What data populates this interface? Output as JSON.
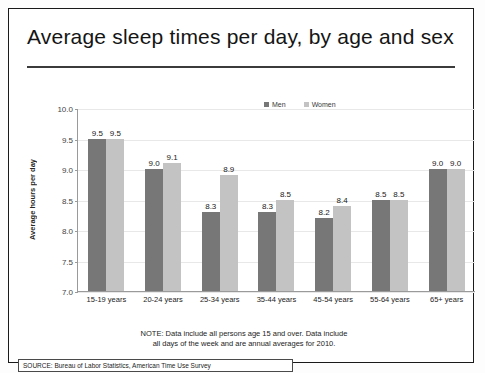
{
  "title": "Average sleep times per day, by age and sex",
  "note_line1": "NOTE: Data include all persons age 15 and over.  Data include",
  "note_line2": "all days of the week and are annual averages for 2010.",
  "source": "SOURCE: Bureau of Labor Statistics, American Time Use Survey",
  "colors": {
    "men": "#777777",
    "women": "#c3c3c3"
  },
  "chart_data": {
    "type": "bar",
    "title": "Average sleep times per day, by age and sex",
    "xlabel": "",
    "ylabel": "Average hours per day",
    "ylim": [
      7.0,
      10.0
    ],
    "ytick_labels": [
      "10.0",
      "9.5",
      "9.0",
      "8.5",
      "8.0",
      "7.5",
      "7.0"
    ],
    "ytick_values": [
      10.0,
      9.5,
      9.0,
      8.5,
      8.0,
      7.5,
      7.0
    ],
    "grid": false,
    "legend_position": "top-right",
    "categories": [
      "15-19 years",
      "20-24 years",
      "25-34 years",
      "35-44 years",
      "45-54 years",
      "55-64 years",
      "65+ years"
    ],
    "series": [
      {
        "name": "Men",
        "values": [
          9.5,
          9.0,
          8.3,
          8.3,
          8.2,
          8.5,
          9.0
        ],
        "labels": [
          "9.5",
          "9.0",
          "8.3",
          "8.3",
          "8.2",
          "8.5",
          "9.0"
        ]
      },
      {
        "name": "Women",
        "values": [
          9.5,
          9.1,
          8.9,
          8.5,
          8.4,
          8.5,
          9.0
        ],
        "labels": [
          "9.5",
          "9.1",
          "8.9",
          "8.5",
          "8.4",
          "8.5",
          "9.0"
        ]
      }
    ]
  }
}
